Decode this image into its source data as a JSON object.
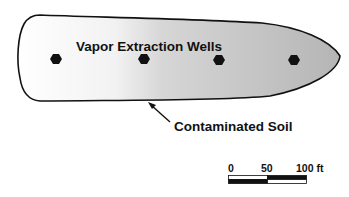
{
  "diagram": {
    "labels": {
      "wells": "Vapor Extraction Wells",
      "soil": "Contaminated Soil"
    },
    "wells_count": 4,
    "colors": {
      "outline": "#111111",
      "gradient_start": "#ffffff",
      "gradient_end": "#b8b8b8",
      "well_fill": "#111111"
    },
    "scale_bar": {
      "ticks": [
        "0",
        "50",
        "100 ft"
      ]
    }
  }
}
